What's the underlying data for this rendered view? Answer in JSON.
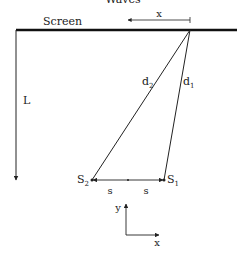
{
  "title_partial": "Waves",
  "labels": {
    "screen": "Screen",
    "x_distance": "x",
    "length": "L",
    "d1": "d",
    "d1_sub": "1",
    "d2": "d",
    "d2_sub": "2",
    "s1": "S",
    "s1_sub": "1",
    "s2": "S",
    "s2_sub": "2",
    "s_left": "s",
    "s_right": "s",
    "axis_y": "y",
    "axis_x": "x"
  },
  "colors": {
    "line": "#222222",
    "screen": "#111111"
  }
}
